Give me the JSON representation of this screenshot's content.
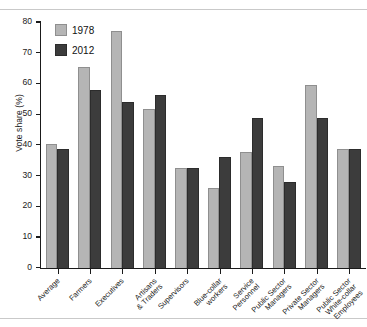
{
  "chart_data": {
    "type": "bar",
    "title": "",
    "xlabel": "",
    "ylabel": "Vote share (%)",
    "ylim": [
      0,
      80
    ],
    "yticks": [
      0,
      10,
      20,
      30,
      40,
      50,
      60,
      70,
      80
    ],
    "grid": false,
    "legend_position": "top-left",
    "categories": [
      "Average",
      "Farmers",
      "Executives",
      "Artisans\n& Traders",
      "Supervisors",
      "Blue-collar\nworkers",
      "Service\nPersonnel",
      "Public Sector\nManagers",
      "Private Sector\nManagers",
      "Public Sector\nWhite-collar\nEmployees"
    ],
    "series": [
      {
        "name": "1978",
        "color": "#b5b5b5",
        "values": [
          40.2,
          65.5,
          77.0,
          51.8,
          32.4,
          26.0,
          37.8,
          33.0,
          59.5,
          38.6
        ]
      },
      {
        "name": "2012",
        "color": "#3c3c3c",
        "values": [
          38.8,
          57.8,
          54.0,
          56.4,
          32.4,
          36.0,
          48.8,
          28.0,
          48.8,
          38.6
        ]
      }
    ]
  }
}
